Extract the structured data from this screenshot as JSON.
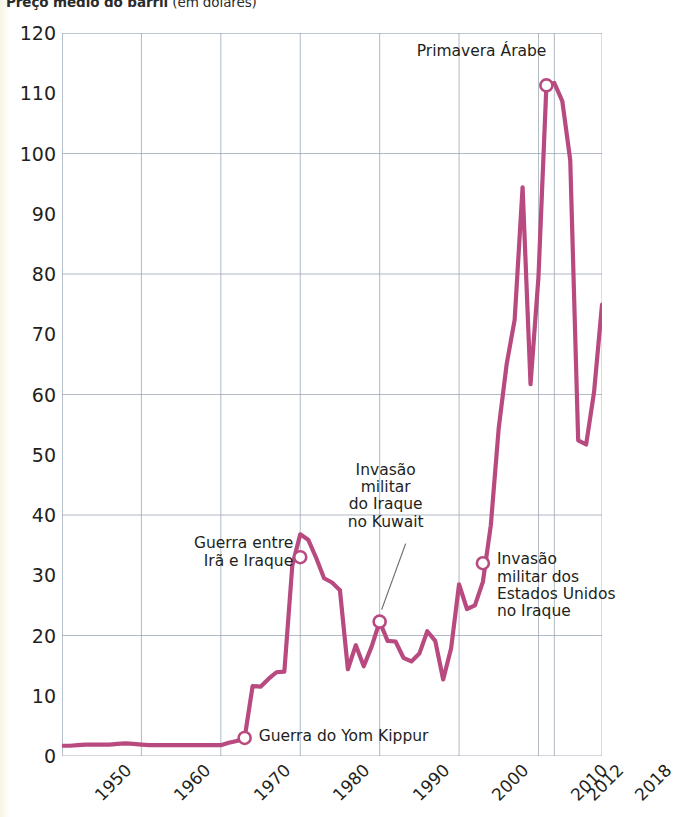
{
  "title": {
    "strong": "Preço médio do barril",
    "light": " (em dólares)"
  },
  "colors": {
    "line": "#b84a80",
    "grid": "#9aa6b4",
    "text": "#231f20",
    "marker_fill": "#ffffff"
  },
  "chart_data": {
    "type": "line",
    "title": "Preço médio do barril (em dólares)",
    "xlabel": "",
    "ylabel": "",
    "xlim": [
      1950,
      2018
    ],
    "ylim": [
      0,
      120
    ],
    "ytick_step": 10,
    "grid": true,
    "grid_y_step": 20,
    "grid_x_step": 10,
    "legend": "none",
    "yticks": [
      0,
      10,
      20,
      30,
      40,
      50,
      60,
      70,
      80,
      90,
      100,
      110,
      120
    ],
    "xticks": [
      1950,
      1960,
      1970,
      1980,
      1990,
      2000,
      2010,
      2012,
      2018
    ],
    "xtick_labels": [
      "1950",
      "1960",
      "1970",
      "1980",
      "1990",
      "2000",
      "2010",
      "2012",
      "2018"
    ],
    "series": [
      {
        "name": "Preço médio do barril",
        "color": "#b84a80",
        "x": [
          1950,
          1951,
          1952,
          1953,
          1954,
          1955,
          1956,
          1957,
          1958,
          1959,
          1960,
          1961,
          1962,
          1963,
          1964,
          1965,
          1966,
          1967,
          1968,
          1969,
          1970,
          1971,
          1972,
          1973,
          1974,
          1975,
          1976,
          1977,
          1978,
          1979,
          1980,
          1981,
          1982,
          1983,
          1984,
          1985,
          1986,
          1987,
          1988,
          1989,
          1990,
          1991,
          1992,
          1993,
          1994,
          1995,
          1996,
          1997,
          1998,
          1999,
          2000,
          2001,
          2002,
          2003,
          2004,
          2005,
          2006,
          2007,
          2008,
          2009,
          2010,
          2011,
          2012,
          2013,
          2014,
          2015,
          2016,
          2017,
          2018
        ],
        "y": [
          1.7,
          1.7,
          1.8,
          1.9,
          1.9,
          1.9,
          1.9,
          2.0,
          2.1,
          2.0,
          1.9,
          1.8,
          1.8,
          1.8,
          1.8,
          1.8,
          1.8,
          1.8,
          1.8,
          1.8,
          1.8,
          2.2,
          2.5,
          3.0,
          11.6,
          11.5,
          12.8,
          13.9,
          14.0,
          31.6,
          36.8,
          35.9,
          32.9,
          29.5,
          28.8,
          27.5,
          14.4,
          18.4,
          14.9,
          18.2,
          22.3,
          19.1,
          19.0,
          16.3,
          15.7,
          17.0,
          20.7,
          19.1,
          12.7,
          17.9,
          28.5,
          24.4,
          25.0,
          28.9,
          38.3,
          54.5,
          65.1,
          72.4,
          94.4,
          61.7,
          79.5,
          111.3,
          111.7,
          108.7,
          98.9,
          52.4,
          51.7,
          60.4,
          74.9
        ]
      }
    ],
    "annotations": [
      {
        "id": "yom-kippur",
        "text": "Guerra do Yom Kippur",
        "lines": [
          "Guerra do Yom Kippur"
        ],
        "marker_x": 1973,
        "marker_y": 3.0,
        "align": "left"
      },
      {
        "id": "ira-iraque",
        "text": "Guerra entre Irã e Iraque",
        "lines": [
          "Guerra entre",
          "Irã e Iraque"
        ],
        "marker_x": 1980,
        "marker_y": 33.0,
        "align": "right"
      },
      {
        "id": "kuwait",
        "text": "Invasão militar do Iraque no Kuwait",
        "lines": [
          "Invasão",
          "militar",
          "do Iraque",
          "no Kuwait"
        ],
        "marker_x": 1990,
        "marker_y": 22.3,
        "align": "center",
        "leader_line": true
      },
      {
        "id": "eua-iraque",
        "text": "Invasão militar dos Estados Unidos no Iraque",
        "lines": [
          "Invasão",
          "militar dos",
          "Estados Unidos",
          "no Iraque"
        ],
        "marker_x": 2003,
        "marker_y": 32.0,
        "align": "left"
      },
      {
        "id": "primavera-arabe",
        "text": "Primavera Árabe",
        "lines": [
          "Primavera Árabe"
        ],
        "marker_x": 2011,
        "marker_y": 111.3,
        "align": "right"
      }
    ]
  }
}
